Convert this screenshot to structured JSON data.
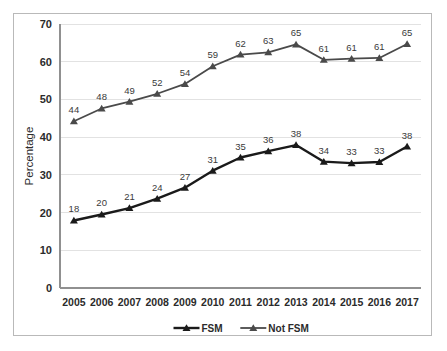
{
  "chart_data": {
    "type": "line",
    "title": "",
    "xlabel": "",
    "ylabel": "Percentage",
    "ylim": [
      0,
      70
    ],
    "yticks": [
      0,
      10,
      20,
      30,
      40,
      50,
      60,
      70
    ],
    "grid": true,
    "legend_position": "bottom",
    "categories": [
      "2005",
      "2006",
      "2007",
      "2008",
      "2009",
      "2010",
      "2011",
      "2012",
      "2013",
      "2014",
      "2015",
      "2016",
      "2017"
    ],
    "series": [
      {
        "name": "FSM",
        "color": "#1a1a1a",
        "marker": "triangle",
        "line_width": 2.4,
        "values": [
          18,
          20,
          21,
          24,
          27,
          31,
          35,
          36,
          38,
          34,
          33,
          33,
          38
        ],
        "plotted_values": [
          17.9,
          19.5,
          21.2,
          23.7,
          26.6,
          31.1,
          34.6,
          36.3,
          37.9,
          33.5,
          33.1,
          33.4,
          37.5
        ],
        "labels": [
          "18",
          "20",
          "21",
          "24",
          "27",
          "31",
          "35",
          "36",
          "38",
          "34",
          "33",
          "33",
          "38"
        ]
      },
      {
        "name": "Not FSM",
        "color": "#4a4a4a",
        "marker": "triangle",
        "line_width": 1.8,
        "values": [
          44,
          48,
          49,
          52,
          54,
          59,
          62,
          63,
          65,
          61,
          61,
          61,
          65
        ],
        "plotted_values": [
          44.2,
          47.6,
          49.4,
          51.5,
          54.1,
          58.8,
          61.9,
          62.5,
          64.6,
          60.5,
          60.8,
          61.0,
          64.7
        ],
        "labels": [
          "44",
          "48",
          "49",
          "52",
          "54",
          "59",
          "62",
          "63",
          "65",
          "61",
          "61",
          "61",
          "65"
        ]
      }
    ]
  },
  "legend": {
    "items": [
      {
        "label": "FSM"
      },
      {
        "label": "Not FSM"
      }
    ]
  },
  "axes": {
    "y_title": "Percentage"
  }
}
